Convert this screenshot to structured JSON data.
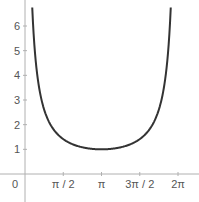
{
  "chart_data": {
    "type": "line",
    "title": "",
    "function": "y = csc(x/2)",
    "xlabel": "",
    "ylabel": "",
    "xlim": [
      -0.35,
      6.5
    ],
    "ylim": [
      -0.5,
      6.8
    ],
    "x_ticks": [
      {
        "value": 0,
        "label": "0"
      },
      {
        "value": 1.5708,
        "label": "π / 2"
      },
      {
        "value": 3.1416,
        "label": "π"
      },
      {
        "value": 4.7124,
        "label": "3π / 2"
      },
      {
        "value": 6.2832,
        "label": "2π"
      }
    ],
    "y_ticks": [
      {
        "value": 1,
        "label": "1"
      },
      {
        "value": 2,
        "label": "2"
      },
      {
        "value": 3,
        "label": "3"
      },
      {
        "value": 4,
        "label": "4"
      },
      {
        "value": 5,
        "label": "5"
      },
      {
        "value": 6,
        "label": "6"
      }
    ],
    "series": [
      {
        "name": "csc(x/2)",
        "color": "#333333",
        "x": [
          0.3,
          0.4,
          0.5,
          0.6,
          0.8,
          1.0,
          1.2,
          1.5708,
          2.0,
          2.5,
          3.1416,
          3.8,
          4.3,
          4.7124,
          5.1,
          5.5,
          5.7,
          5.9,
          6.0
        ],
        "values": [
          6.69,
          5.03,
          4.03,
          3.38,
          2.57,
          2.09,
          1.77,
          1.41,
          1.19,
          1.05,
          1.0,
          1.06,
          1.2,
          1.41,
          1.79,
          2.62,
          3.44,
          5.23,
          7.1
        ]
      }
    ],
    "grid": false,
    "legend": null
  },
  "colors": {
    "axis": "#b0b0b0",
    "curve": "#333333",
    "label": "#555555"
  }
}
